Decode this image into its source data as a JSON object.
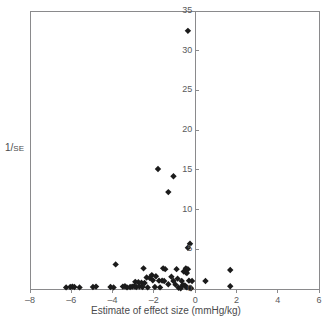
{
  "chart_data": {
    "type": "scatter",
    "title": "",
    "subtitle": "",
    "xlabel": "Estimate of effect size (mmHg/kg)",
    "ylabel_main": "1/",
    "ylabel_sub": "SE",
    "ylabel_full": "1/SE",
    "xlim": [
      -8,
      6
    ],
    "ylim": [
      0,
      35
    ],
    "xticks": [
      -8,
      -6,
      -4,
      -2,
      0,
      2,
      4,
      6
    ],
    "xticklabels": [
      "–8",
      "–6",
      "–4",
      "–2",
      "0",
      "2",
      "4",
      "6"
    ],
    "yticks": [
      0,
      5,
      10,
      15,
      20,
      25,
      30,
      35
    ],
    "yticklabels": [
      "0",
      "5",
      "10",
      "15",
      "20",
      "25",
      "30",
      "35"
    ],
    "grid": false,
    "legend": null,
    "marker": "diamond",
    "marker_color": "#1b1b1b",
    "marker_size": 3.2,
    "axis_color": "#8a8a8c",
    "reference_line_x": 0,
    "points": [
      [
        -0.35,
        32.5
      ],
      [
        -1.8,
        15.1
      ],
      [
        -1.05,
        14.2
      ],
      [
        -1.3,
        12.2
      ],
      [
        -0.25,
        5.7
      ],
      [
        -0.35,
        5.2
      ],
      [
        -3.85,
        3.1
      ],
      [
        -2.5,
        2.6
      ],
      [
        -1.55,
        2.6
      ],
      [
        -1.45,
        2.5
      ],
      [
        -0.9,
        2.5
      ],
      [
        -0.45,
        2.6
      ],
      [
        -0.35,
        2.5
      ],
      [
        -0.55,
        2.2
      ],
      [
        -0.45,
        2.1
      ],
      [
        -0.4,
        2.0
      ],
      [
        1.7,
        2.4
      ],
      [
        -2.1,
        1.75
      ],
      [
        -1.9,
        1.6
      ],
      [
        -2.35,
        1.45
      ],
      [
        -2.2,
        1.4
      ],
      [
        -1.15,
        1.55
      ],
      [
        -0.85,
        1.3
      ],
      [
        -2.05,
        1.1
      ],
      [
        -1.75,
        1.05
      ],
      [
        -1.6,
        1.05
      ],
      [
        -1.5,
        1.0
      ],
      [
        -1.05,
        1.0
      ],
      [
        -0.65,
        1.0
      ],
      [
        -0.3,
        1.05
      ],
      [
        -0.15,
        1.0
      ],
      [
        0.5,
        1.0
      ],
      [
        -2.9,
        0.9
      ],
      [
        -2.75,
        0.85
      ],
      [
        -2.6,
        0.8
      ],
      [
        -2.45,
        0.75
      ],
      [
        -1.3,
        0.6
      ],
      [
        -0.95,
        0.55
      ],
      [
        -0.6,
        0.5
      ],
      [
        -0.5,
        0.45
      ],
      [
        -0.45,
        0.3
      ],
      [
        -0.4,
        0.2
      ],
      [
        1.7,
        0.35
      ],
      [
        -6.25,
        0.2
      ],
      [
        -6.05,
        0.25
      ],
      [
        -5.95,
        0.3
      ],
      [
        -5.85,
        0.25
      ],
      [
        -5.6,
        0.2
      ],
      [
        -4.95,
        0.25
      ],
      [
        -4.8,
        0.3
      ],
      [
        -4.1,
        0.25
      ],
      [
        -3.95,
        0.2
      ],
      [
        -3.5,
        0.3
      ],
      [
        -3.4,
        0.35
      ],
      [
        -3.3,
        0.2
      ],
      [
        -3.15,
        0.25
      ],
      [
        -3.05,
        0.3
      ],
      [
        -2.95,
        0.35
      ],
      [
        -2.85,
        0.25
      ],
      [
        -2.7,
        0.3
      ],
      [
        -2.55,
        0.25
      ],
      [
        -2.3,
        0.2
      ],
      [
        -1.95,
        0.25
      ],
      [
        -1.7,
        0.2
      ],
      [
        -0.8,
        0.15
      ],
      [
        -0.7,
        0.1
      ],
      [
        -0.25,
        0.15
      ],
      [
        -0.2,
        0.1
      ]
    ]
  }
}
